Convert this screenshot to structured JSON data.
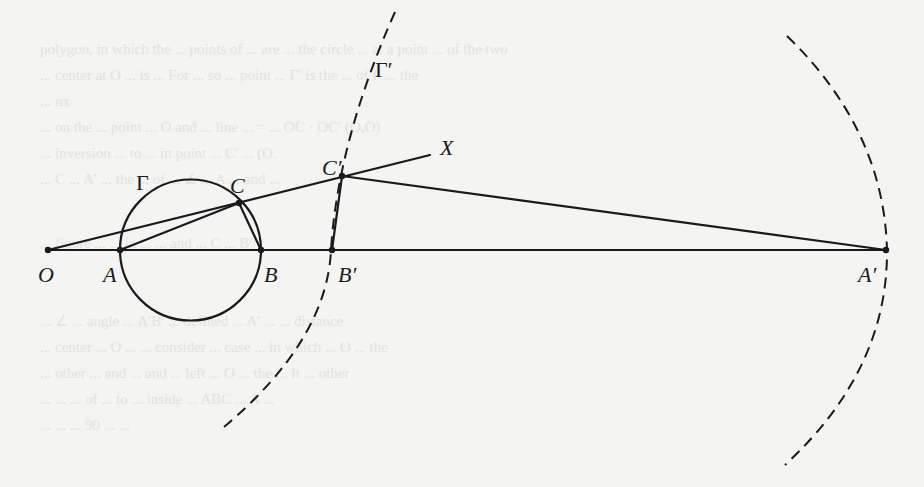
{
  "figure": {
    "colors": {
      "ink": "#1a1a1a",
      "paper": "#f4f4f2",
      "ghost_text": "#e3e3e0"
    },
    "points": {
      "O": {
        "label": "O",
        "x": 48,
        "y": 250
      },
      "A": {
        "label": "A",
        "x": 120,
        "y": 250
      },
      "B": {
        "label": "B",
        "x": 261,
        "y": 250
      },
      "Bp": {
        "label": "B′",
        "x": 332,
        "y": 250
      },
      "Ap": {
        "label": "A′",
        "x": 886,
        "y": 250
      },
      "C": {
        "label": "C",
        "x": 239,
        "y": 203
      },
      "Cp": {
        "label": "C′",
        "x": 342,
        "y": 176
      },
      "X": {
        "label": "X",
        "x": 430,
        "y": 155
      }
    },
    "curves": {
      "gamma": {
        "label": "Γ",
        "cx": 190.5,
        "cy": 250,
        "r": 70.5,
        "style": "solid"
      },
      "gamma_prime": {
        "label": "Γ′",
        "style": "dashed"
      }
    },
    "label_positions": {
      "O": {
        "x": 38,
        "y": 282
      },
      "A": {
        "x": 103,
        "y": 282
      },
      "B": {
        "x": 264,
        "y": 282
      },
      "Bp": {
        "x": 338,
        "y": 282
      },
      "Ap": {
        "x": 858,
        "y": 282
      },
      "C": {
        "x": 230,
        "y": 193
      },
      "Cp": {
        "x": 322,
        "y": 175
      },
      "X": {
        "x": 440,
        "y": 155
      },
      "gamma": {
        "x": 136,
        "y": 190
      },
      "gamma_prime": {
        "x": 375,
        "y": 77
      }
    }
  },
  "background_text": [
    "polygon, in which the ... points of ... are ... the circle ... at a point ... of the two",
    "... center at O ... is ... For ... so ... point ... Γ′ is the ... of Γ ... the",
    "... nx",
    "... on the ... point ... O and ... line ... = ... OC · OC′ (O,O)",
    "... inversion ... to ... in point ... C′ ... (O.",
    "... C ... A′ ... the ... of ... ∠ ... A ... and ... ",
    "... figure ... ... in ... ... and ... C ... B′",
    "... ∠ ... angle ... A′B′ ... defined ... A′ ... ... distance",
    "... center ... O ... ... consider ... case ... in which ... O ... the",
    "... other ... and ... and ... left ... O ... the ... It ... other",
    "... ... ... of ... to ... inside ... ABC ... A ... ",
    "... ... ... 90 ... ... "
  ]
}
